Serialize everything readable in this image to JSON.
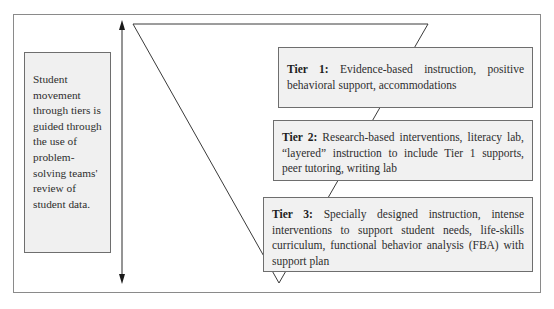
{
  "diagram": {
    "type": "tiered-intervention-model",
    "side_note": {
      "text": "Student movement through tiers is guided through the use of problem-solving teams' review of student data."
    },
    "arrow": {
      "direction": "bidirectional-vertical"
    },
    "shape": "inverted-triangle",
    "tiers": [
      {
        "label": "Tier 1:",
        "description": "Evidence-based instruction, positive behavioral support, accommodations"
      },
      {
        "label": "Tier 2:",
        "description": "Research-based interventions, literacy lab, “layered” instruction to include Tier 1 supports, peer tutoring, writing lab"
      },
      {
        "label": "Tier 3:",
        "description": "Specially designed instruction, intense interventions to support student needs, life-skills curriculum, functional behavior analysis (FBA) with support plan"
      }
    ],
    "colors": {
      "box_fill": "#f1f1f1",
      "box_border": "#6e6e6e",
      "frame_border": "#8a8a8a",
      "line": "#3a3a3a"
    }
  }
}
